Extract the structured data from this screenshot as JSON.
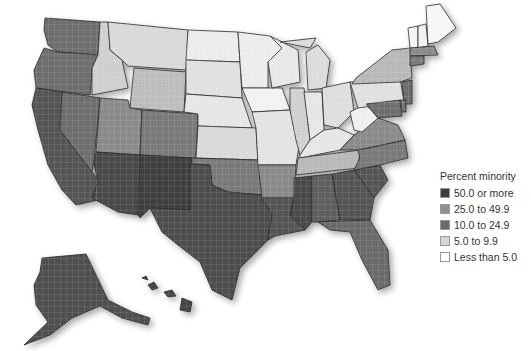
{
  "map": {
    "subject": "Percent minority by county, United States",
    "regions_shown": [
      "Contiguous United States",
      "Alaska",
      "Hawaii"
    ],
    "state_fills": {
      "WA": "#6e6e6e",
      "OR": "#6e6e6e",
      "CA": "#555555",
      "NV": "#6e6e6e",
      "ID": "#cfcfcf",
      "MT": "#d9d9d9",
      "WY": "#bdbdbd",
      "UT": "#8a8a8a",
      "AZ": "#4a4a4a",
      "NM": "#3f3f3f",
      "CO": "#7a7a7a",
      "ND": "#ececec",
      "SD": "#e0e0e0",
      "NE": "#e6e6e6",
      "KS": "#d9d9d9",
      "OK": "#7a7a7a",
      "TX": "#4e4e4e",
      "MN": "#ececec",
      "IA": "#f2f2f2",
      "MO": "#e3e3e3",
      "AR": "#8a8a8a",
      "LA": "#555555",
      "WI": "#e8e8e8",
      "IL": "#d0d0d0",
      "MI": "#dcdcdc",
      "IN": "#e6e6e6",
      "OH": "#dedede",
      "KY": "#e6e6e6",
      "TN": "#b8b8b8",
      "MS": "#4a4a4a",
      "AL": "#5e5e5e",
      "GA": "#555555",
      "FL": "#6a6a6a",
      "SC": "#555555",
      "NC": "#7a7a7a",
      "VA": "#8a8a8a",
      "WV": "#efefef",
      "PA": "#e0e0e0",
      "NY": "#b8b8b8",
      "VT": "#f4f4f4",
      "NH": "#f0f0f0",
      "ME": "#f6f6f6",
      "MA": "#8a8a8a",
      "CT": "#7a7a7a",
      "NJ": "#6e6e6e",
      "MD": "#6e6e6e",
      "DE": "#6e6e6e",
      "AK": "#505050",
      "HI": "#444444"
    }
  },
  "legend": {
    "title": "Percent minority",
    "items": [
      {
        "label": "50.0 or more",
        "color": "#3d3d3d"
      },
      {
        "label": "25.0 to 49.9",
        "color": "#8f8f8f"
      },
      {
        "label": "10.0 to 24.9",
        "color": "#6a6a6a"
      },
      {
        "label": "5.0 to 9.9",
        "color": "#d6d6d6"
      },
      {
        "label": "Less than 5.0",
        "color": "#ffffff"
      }
    ]
  }
}
